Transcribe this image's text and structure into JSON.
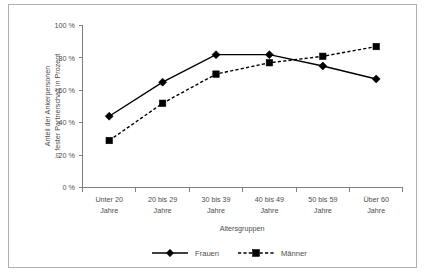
{
  "chart_data": {
    "type": "line",
    "title": "",
    "xlabel": "Altersgruppen",
    "ylabel_line1": "Anteil der Ankerpersonen",
    "ylabel_line2": "in fester Partnerschaft in Prozent",
    "categories": [
      "Unter 20 Jahre",
      "20 bis 29 Jahre",
      "30 bis 39 Jahre",
      "40 bis 49 Jahre",
      "50 bis 59 Jahre",
      "Über 60 Jahre"
    ],
    "category_lines": [
      [
        "Unter 20",
        "Jahre"
      ],
      [
        "20 bis 29",
        "Jahre"
      ],
      [
        "30 bis 39",
        "Jahre"
      ],
      [
        "40 bis 49",
        "Jahre"
      ],
      [
        "50 bis 59",
        "Jahre"
      ],
      [
        "Über 60",
        "Jahre"
      ]
    ],
    "series": [
      {
        "name": "Frauen",
        "style": "solid",
        "marker": "diamond",
        "values": [
          44,
          65,
          82,
          82,
          75,
          67
        ]
      },
      {
        "name": "Männer",
        "style": "dashed",
        "marker": "square",
        "values": [
          29,
          52,
          70,
          77,
          81,
          87
        ]
      }
    ],
    "ylim": [
      0,
      100
    ],
    "ytick_values": [
      0,
      20,
      40,
      60,
      80,
      100
    ],
    "ytick_labels": [
      "0 %",
      "20 %",
      "40 %",
      "60 %",
      "80 %",
      "100 %"
    ],
    "grid": false,
    "legend_position": "bottom",
    "line_color": "#000000",
    "axis_color": "#808080",
    "text_color": "#4d4d4d",
    "background_color": "#ffffff"
  },
  "ticks": {
    "y0": "0 %",
    "y20": "20 %",
    "y40": "40 %",
    "y60": "60 %",
    "y80": "80 %",
    "y100": "100 %"
  },
  "categories": {
    "c0_l0": "Unter 20",
    "c0_l1": "Jahre",
    "c1_l0": "20 bis 29",
    "c1_l1": "Jahre",
    "c2_l0": "30 bis 39",
    "c2_l1": "Jahre",
    "c3_l0": "40 bis 49",
    "c3_l1": "Jahre",
    "c4_l0": "50 bis 59",
    "c4_l1": "Jahre",
    "c5_l0": "Über 60",
    "c5_l1": "Jahre"
  },
  "axis_titles": {
    "x": "Altersgruppen",
    "y_line1": "Anteil der Ankerpersonen",
    "y_line2": "in fester Partnerschaft in Prozent"
  },
  "legend": {
    "series1": "Frauen",
    "series2": "Männer"
  }
}
